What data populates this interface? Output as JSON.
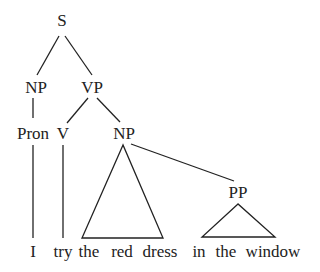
{
  "tree": {
    "nodes": {
      "S": "S",
      "NP_subj": "NP",
      "VP": "VP",
      "Pron": "Pron",
      "V": "V",
      "NP_obj": "NP",
      "PP": "PP"
    },
    "words": {
      "w1": "I",
      "w2": "try",
      "w3": "the",
      "w4": "red",
      "w5": "dress",
      "w6": "in",
      "w7": "the",
      "w8": "window"
    },
    "colors": {
      "line": "#222222",
      "text": "#222222",
      "background": "#ffffff"
    }
  }
}
